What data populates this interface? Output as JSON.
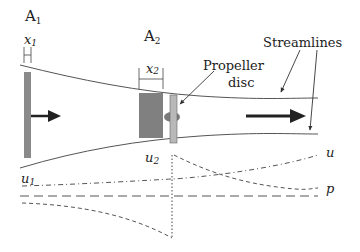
{
  "labels": {
    "a1": "A",
    "a1_sub": "1",
    "a2": "A",
    "a2_sub": "2",
    "x1": "x",
    "x1_sub": "1",
    "x2": "x",
    "x2_sub": "2",
    "propeller_line1": "Propeller",
    "propeller_line2": "disc",
    "streamlines": "Streamlines",
    "u1": "u",
    "u1_sub": "1",
    "u2": "u",
    "u2_sub": "2",
    "u": "u",
    "p": "p"
  },
  "colors": {
    "line": "#555555",
    "bar_dark": "#8a8a8a",
    "block": "#808080",
    "disc_bar": "#b0b0b0",
    "disc_ellipse": "#7a7a7a",
    "arrow": "#222222",
    "text": "#222222"
  }
}
